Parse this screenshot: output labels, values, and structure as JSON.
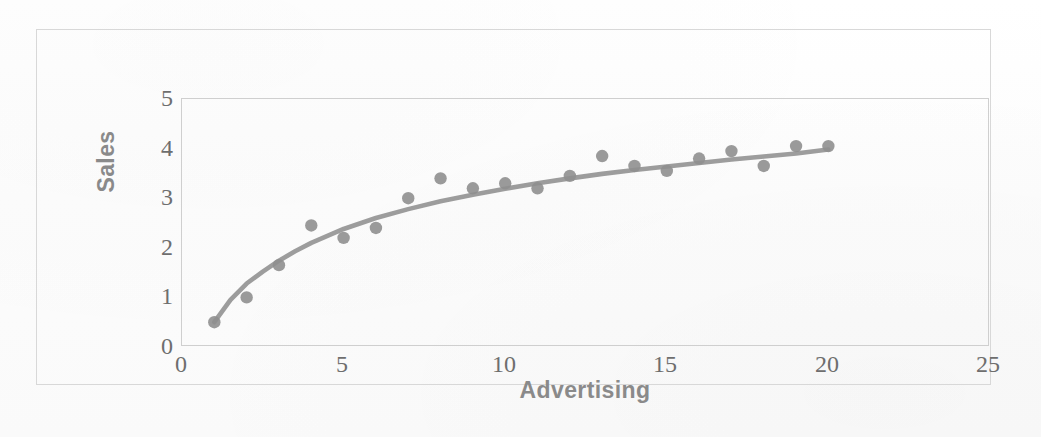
{
  "chart_data": {
    "type": "scatter",
    "title": "",
    "subtitle": "",
    "xlabel": "Advertising",
    "ylabel": "Sales",
    "xlim": [
      0,
      25
    ],
    "ylim": [
      0,
      5
    ],
    "xticks": [
      "0",
      "5",
      "10",
      "15",
      "20",
      "25"
    ],
    "yticks": [
      "0",
      "1",
      "2",
      "3",
      "4",
      "5"
    ],
    "xtick_values": [
      0,
      5,
      10,
      15,
      20,
      25
    ],
    "ytick_values": [
      0,
      1,
      2,
      3,
      4,
      5
    ],
    "grid": false,
    "legend": "none",
    "legend_position": "none",
    "annotations": [],
    "series": [
      {
        "name": "Sales observations",
        "type": "scatter",
        "marker": "circle",
        "color": "#8f8f8f",
        "x": [
          1,
          2,
          3,
          4,
          5,
          6,
          7,
          8,
          9,
          10,
          11,
          12,
          13,
          14,
          15,
          16,
          17,
          18,
          19,
          20
        ],
        "values": [
          0.5,
          1.0,
          1.65,
          2.45,
          2.2,
          2.4,
          3.0,
          3.4,
          3.2,
          3.3,
          3.2,
          3.45,
          3.85,
          3.65,
          3.55,
          3.8,
          3.95,
          3.65,
          4.05,
          4.05
        ]
      },
      {
        "name": "Fitted logarithmic trend curve",
        "type": "line",
        "color": "#8f8f8f",
        "x": [
          1,
          1.5,
          2,
          2.5,
          3,
          3.5,
          4,
          5,
          6,
          7,
          8,
          9,
          10,
          11,
          12,
          13,
          14,
          15,
          16,
          17,
          18,
          19,
          20
        ],
        "values": [
          0.5,
          0.95,
          1.28,
          1.52,
          1.74,
          1.93,
          2.1,
          2.38,
          2.6,
          2.78,
          2.94,
          3.07,
          3.19,
          3.3,
          3.4,
          3.49,
          3.57,
          3.64,
          3.71,
          3.78,
          3.84,
          3.9,
          3.98
        ]
      }
    ]
  },
  "colors": {
    "marker": "#8f8f8f",
    "curve": "#8f8f8f",
    "axis_text": "#6e6e6e",
    "axis_title": "#8a8a8a",
    "plot_border": "#cfcfcf",
    "frame_border": "#d8d8d8",
    "background": "#fdfdfd"
  }
}
